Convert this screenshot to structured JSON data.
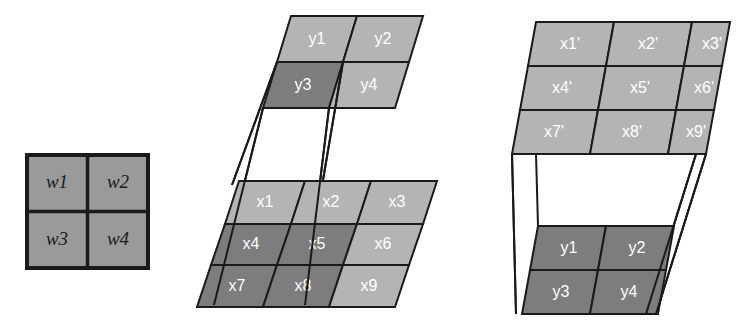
{
  "figure": {
    "background": "#ffffff",
    "width": 744,
    "height": 329
  },
  "colors": {
    "cell_light": "#b4b4b4",
    "cell_mid": "#9a9a9a",
    "cell_dark": "#7d7d7d",
    "stroke": "#1a1a1a",
    "label_light": "#ffffff",
    "label_dark": "#1a1a1a",
    "background": "#ffffff"
  },
  "panels": {
    "kernel": {
      "name": "weight-kernel",
      "shape": "square",
      "rows": 2,
      "cols": 2,
      "fill": "cell_mid",
      "cells": [
        {
          "id": "w1",
          "label": "w1",
          "row": 0,
          "col": 0,
          "shade": "mid"
        },
        {
          "id": "w2",
          "label": "w2",
          "row": 0,
          "col": 1,
          "shade": "mid"
        },
        {
          "id": "w3",
          "label": "w3",
          "row": 1,
          "col": 0,
          "shade": "mid"
        },
        {
          "id": "w4",
          "label": "w4",
          "row": 1,
          "col": 1,
          "shade": "mid"
        }
      ]
    },
    "middle": {
      "name": "single-output-mapping",
      "output_grid": {
        "name": "y-output-grid",
        "rows": 2,
        "cols": 2,
        "cells": [
          {
            "id": "y1",
            "label": "y1",
            "row": 0,
            "col": 0,
            "shade": "light"
          },
          {
            "id": "y2",
            "label": "y2",
            "row": 0,
            "col": 1,
            "shade": "light"
          },
          {
            "id": "y3",
            "label": "y3",
            "row": 1,
            "col": 0,
            "shade": "dark"
          },
          {
            "id": "y4",
            "label": "y4",
            "row": 1,
            "col": 1,
            "shade": "light"
          }
        ]
      },
      "input_grid": {
        "name": "x-input-grid",
        "rows": 3,
        "cols": 3,
        "cells": [
          {
            "id": "x1",
            "label": "x1",
            "row": 0,
            "col": 0,
            "shade": "light"
          },
          {
            "id": "x2",
            "label": "x2",
            "row": 0,
            "col": 1,
            "shade": "light"
          },
          {
            "id": "x3",
            "label": "x3",
            "row": 0,
            "col": 2,
            "shade": "light"
          },
          {
            "id": "x4",
            "label": "x4",
            "row": 1,
            "col": 0,
            "shade": "dark"
          },
          {
            "id": "x5",
            "label": "x5",
            "row": 1,
            "col": 1,
            "shade": "dark"
          },
          {
            "id": "x6",
            "label": "x6",
            "row": 1,
            "col": 2,
            "shade": "light"
          },
          {
            "id": "x7",
            "label": "x7",
            "row": 2,
            "col": 0,
            "shade": "dark"
          },
          {
            "id": "x8",
            "label": "x8",
            "row": 2,
            "col": 1,
            "shade": "dark"
          },
          {
            "id": "x9",
            "label": "x9",
            "row": 2,
            "col": 2,
            "shade": "light"
          }
        ]
      },
      "connector_count": 4
    },
    "right": {
      "name": "full-mapping",
      "input_grid": {
        "name": "x-prime-input-grid",
        "rows": 3,
        "cols": 3,
        "cells": [
          {
            "id": "x1p",
            "label": "x1'",
            "row": 0,
            "col": 0,
            "shade": "light"
          },
          {
            "id": "x2p",
            "label": "x2'",
            "row": 0,
            "col": 1,
            "shade": "light"
          },
          {
            "id": "x3p",
            "label": "x3'",
            "row": 0,
            "col": 2,
            "shade": "light"
          },
          {
            "id": "x4p",
            "label": "x4'",
            "row": 1,
            "col": 0,
            "shade": "light"
          },
          {
            "id": "x5p",
            "label": "x5'",
            "row": 1,
            "col": 1,
            "shade": "light"
          },
          {
            "id": "x6p",
            "label": "x6'",
            "row": 1,
            "col": 2,
            "shade": "light"
          },
          {
            "id": "x7p",
            "label": "x7'",
            "row": 2,
            "col": 0,
            "shade": "light"
          },
          {
            "id": "x8p",
            "label": "x8'",
            "row": 2,
            "col": 1,
            "shade": "light"
          },
          {
            "id": "x9p",
            "label": "x9'",
            "row": 2,
            "col": 2,
            "shade": "light"
          }
        ]
      },
      "output_grid": {
        "name": "y-output-grid-right",
        "rows": 2,
        "cols": 2,
        "cells": [
          {
            "id": "y1r",
            "label": "y1",
            "row": 0,
            "col": 0,
            "shade": "dark"
          },
          {
            "id": "y2r",
            "label": "y2",
            "row": 0,
            "col": 1,
            "shade": "dark"
          },
          {
            "id": "y3r",
            "label": "y3",
            "row": 1,
            "col": 0,
            "shade": "dark"
          },
          {
            "id": "y4r",
            "label": "y4",
            "row": 1,
            "col": 1,
            "shade": "dark"
          }
        ]
      },
      "connector_count": 4
    }
  }
}
